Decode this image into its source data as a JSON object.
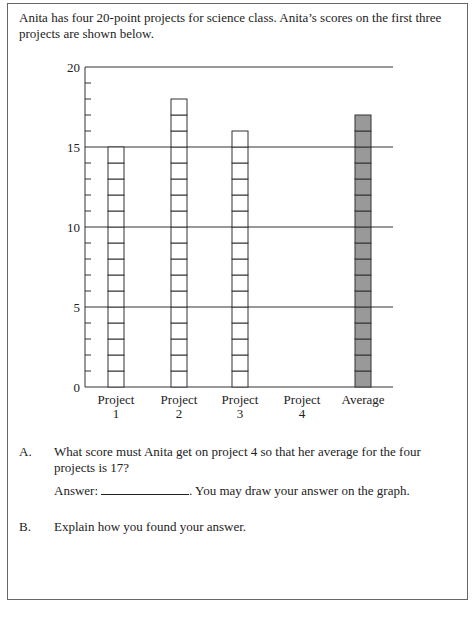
{
  "intro": "Anita has four 20-point projects for science class. Anita’s scores on the first three projects are shown below.",
  "chart_data": {
    "type": "bar",
    "title": "",
    "xlabel": "",
    "ylabel": "",
    "categories": [
      "Project 1",
      "Project 2",
      "Project 3",
      "Project 4",
      "Average"
    ],
    "values": [
      15,
      18,
      16,
      null,
      17
    ],
    "ylim": [
      0,
      20
    ],
    "yticks": [
      0,
      5,
      10,
      15,
      20
    ],
    "grid": true,
    "bar_colors": [
      "#ffffff",
      "#ffffff",
      "#ffffff",
      "#ffffff",
      "#999999"
    ],
    "stacked_unit_blocks": true
  },
  "axis": {
    "y_labels": [
      "0",
      "5",
      "10",
      "15",
      "20"
    ],
    "x_labels": [
      {
        "line1": "Project",
        "line2": "1"
      },
      {
        "line1": "Project",
        "line2": "2"
      },
      {
        "line1": "Project",
        "line2": "3"
      },
      {
        "line1": "Project",
        "line2": "4"
      },
      {
        "line1": "Average",
        "line2": ""
      }
    ]
  },
  "questions": {
    "a": {
      "letter": "A.",
      "text": "What score must Anita get on project 4 so that her average for the four projects is 17?",
      "answer_label": "Answer:",
      "answer_suffix": ". You may draw your answer on the graph."
    },
    "b": {
      "letter": "B.",
      "text": "Explain how you found your answer."
    }
  }
}
